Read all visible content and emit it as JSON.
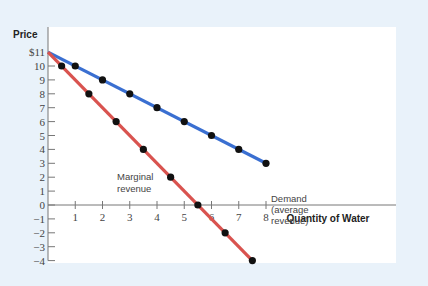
{
  "chart_data": {
    "type": "line",
    "title": "",
    "xlabel": "Quantity of Water",
    "ylabel": "Price",
    "xlim": [
      0,
      8
    ],
    "ylim": [
      -4,
      11
    ],
    "x_ticks": [
      "1",
      "2",
      "3",
      "4",
      "5",
      "6",
      "7",
      "8"
    ],
    "y_ticks": [
      "$11",
      "10",
      "9",
      "8",
      "7",
      "6",
      "5",
      "4",
      "3",
      "2",
      "1",
      "0",
      "−1",
      "−2",
      "−3",
      "−4"
    ],
    "grid": false,
    "series": [
      {
        "name": "Demand (average revenue)",
        "color": "#3a6fd1",
        "line": [
          [
            0,
            11
          ],
          [
            8,
            3
          ]
        ],
        "points": [
          [
            1,
            10
          ],
          [
            2,
            9
          ],
          [
            3,
            8
          ],
          [
            4,
            7
          ],
          [
            5,
            6
          ],
          [
            6,
            5
          ],
          [
            7,
            4
          ],
          [
            8,
            3
          ]
        ]
      },
      {
        "name": "Marginal revenue",
        "color": "#d9534f",
        "line": [
          [
            0,
            11
          ],
          [
            7.5,
            -4
          ]
        ],
        "points": [
          [
            0.5,
            10
          ],
          [
            1.5,
            8
          ],
          [
            2.5,
            6
          ],
          [
            3.5,
            4
          ],
          [
            4.5,
            2
          ],
          [
            5.5,
            0
          ],
          [
            6.5,
            -2
          ],
          [
            7.5,
            -4
          ]
        ]
      }
    ],
    "annotations": [
      {
        "text_lines": [
          "Demand",
          "(average",
          "revenue)"
        ],
        "x": 8,
        "y": 3
      },
      {
        "text_lines": [
          "Marginal",
          "revenue"
        ],
        "x": 3.5,
        "y": 1.5
      }
    ]
  },
  "labels": {
    "ylabel": "Price",
    "xlabel": "Quantity of Water",
    "demand": [
      "Demand",
      "(average",
      "revenue)"
    ],
    "mr": [
      "Marginal",
      "revenue"
    ]
  }
}
